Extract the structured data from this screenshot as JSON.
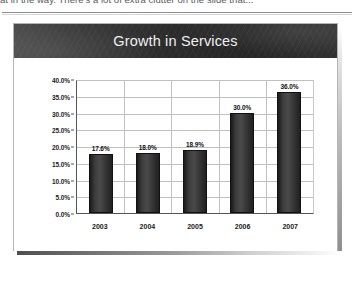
{
  "page": {
    "clipped_body_text": "at in the way. There's a lot of extra clutter on the slide that..."
  },
  "slide": {
    "title": "Growth in Services"
  },
  "chart_data": {
    "type": "bar",
    "title": "Growth in Services",
    "categories": [
      "2003",
      "2004",
      "2005",
      "2006",
      "2007"
    ],
    "values": [
      17.6,
      18.0,
      18.9,
      30.0,
      36.0
    ],
    "data_labels": [
      "17.6%",
      "18.0%",
      "18.9%",
      "30.0%",
      "36.0%"
    ],
    "xlabel": "",
    "ylabel": "",
    "ylim": [
      0,
      40
    ],
    "ytick_values": [
      0,
      5,
      10,
      15,
      20,
      25,
      30,
      35,
      40
    ],
    "ytick_labels": [
      "0.0%",
      "5.0%",
      "10.0%",
      "15.0%",
      "20.0%",
      "25.0%",
      "30.0%",
      "35.0%",
      "40.0%"
    ],
    "grid": true,
    "grid_axes": "both",
    "legend": false,
    "legend_position": "none",
    "series_color": "#3c3c3c",
    "gridline_color": "#c0c0c0",
    "axis_color": "#555555",
    "plot_background": "#ffffff"
  },
  "theme": {
    "banner_background": "#2c2c2c",
    "banner_text": "#efefef",
    "slide_background": "#ffffff",
    "slide_border": "#b4b4b4"
  }
}
